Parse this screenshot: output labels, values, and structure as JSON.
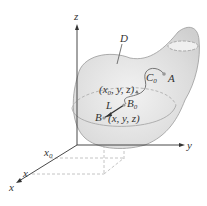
{
  "figure": {
    "axes": {
      "z_label": "z",
      "y_label": "y",
      "x_label": "x",
      "x_tick_x0": "x",
      "x_tick_x0_sub": "0",
      "x_tick_x": "x"
    },
    "labels": {
      "region": "D",
      "curve": "C",
      "curve_sub": "0",
      "point_a": "A",
      "point_b0": "B",
      "point_b0_sub": "0",
      "point_b": "B",
      "segment": "L",
      "coord_b0_prefix": "(x",
      "coord_b0_sub": "0",
      "coord_b0_suffix": ", y, z)",
      "coord_b": "(x, y, z)"
    },
    "colors": {
      "surface_fill": "#e4e4e4",
      "surface_edge": "#9a9a9a",
      "axis": "#333333",
      "dashed": "#b0b0b0"
    }
  }
}
